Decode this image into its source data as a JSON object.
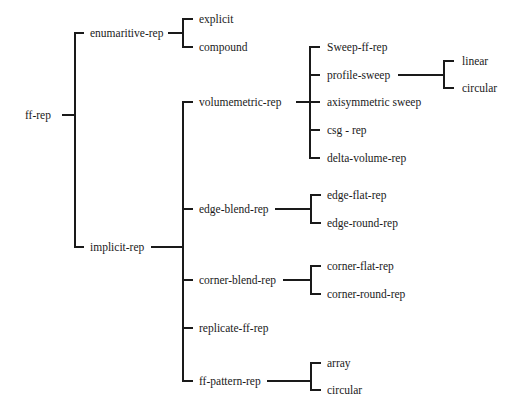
{
  "diagram": {
    "type": "tree",
    "line_color": "#1a1a1a",
    "root": {
      "label": "ff-rep",
      "children": [
        {
          "label": "enumaritive-rep",
          "children": [
            {
              "label": "explicit"
            },
            {
              "label": "compound"
            }
          ]
        },
        {
          "label": "implicit-rep",
          "children": [
            {
              "label": "volumemetric-rep",
              "children": [
                {
                  "label": "Sweep-ff-rep"
                },
                {
                  "label": "profile-sweep",
                  "children": [
                    {
                      "label": "linear"
                    },
                    {
                      "label": "circular"
                    }
                  ]
                },
                {
                  "label": "axisymmetric sweep"
                },
                {
                  "label": "csg - rep"
                },
                {
                  "label": "delta-volume-rep"
                }
              ]
            },
            {
              "label": "edge-blend-rep",
              "children": [
                {
                  "label": "edge-flat-rep"
                },
                {
                  "label": "edge-round-rep"
                }
              ]
            },
            {
              "label": "corner-blend-rep",
              "children": [
                {
                  "label": "corner-flat-rep"
                },
                {
                  "label": "corner-round-rep"
                }
              ]
            },
            {
              "label": "replicate-ff-rep"
            },
            {
              "label": "ff-pattern-rep",
              "children": [
                {
                  "label": "array"
                },
                {
                  "label": "circular"
                }
              ]
            }
          ]
        }
      ]
    }
  },
  "nodes": {
    "ff_rep": "ff-rep",
    "enumaritive_rep": "enumaritive-rep",
    "explicit": "explicit",
    "compound": "compound",
    "implicit_rep": "implicit-rep",
    "volumemetric_rep": "volumemetric-rep",
    "sweep_ff_rep": "Sweep-ff-rep",
    "profile_sweep": "profile-sweep",
    "linear": "linear",
    "profile_circular": "circular",
    "axisymmetric_sweep": "axisymmetric sweep",
    "csg_rep": "csg - rep",
    "delta_volume_rep": "delta-volume-rep",
    "edge_blend_rep": "edge-blend-rep",
    "edge_flat_rep": "edge-flat-rep",
    "edge_round_rep": "edge-round-rep",
    "corner_blend_rep": "corner-blend-rep",
    "corner_flat_rep": "corner-flat-rep",
    "corner_round_rep": "corner-round-rep",
    "replicate_ff_rep": "replicate-ff-rep",
    "ff_pattern_rep": "ff-pattern-rep",
    "array": "array",
    "pattern_circular": "circular"
  }
}
